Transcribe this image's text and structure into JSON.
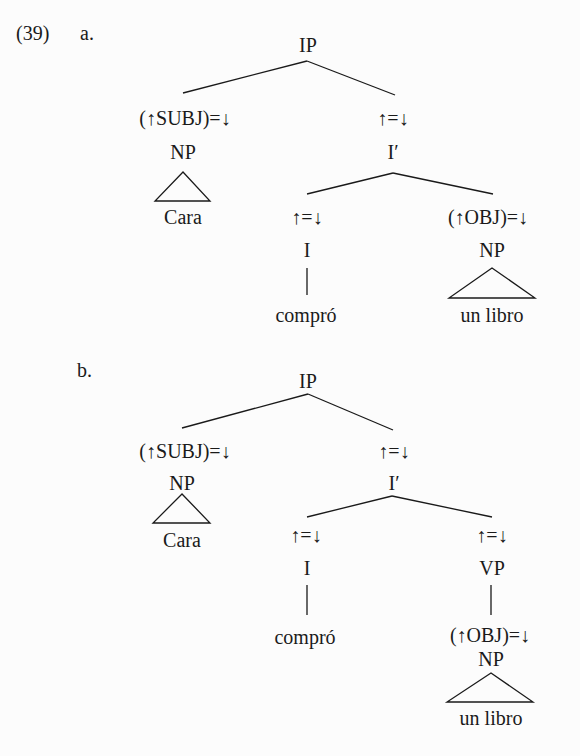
{
  "example_number": "(39)",
  "trees": [
    {
      "label": "a.",
      "root": "IP",
      "subj_annotation": "(↑SUBJ)=↓",
      "subj_category": "NP",
      "subj_word": "Cara",
      "ibar_annotation": "↑=↓",
      "ibar_category": "I′",
      "i_annotation": "↑=↓",
      "i_category": "I",
      "i_word": "compró",
      "obj_annotation": "(↑OBJ)=↓",
      "obj_category": "NP",
      "obj_words": "un libro"
    },
    {
      "label": "b.",
      "root": "IP",
      "subj_annotation": "(↑SUBJ)=↓",
      "subj_category": "NP",
      "subj_word": "Cara",
      "ibar_annotation": "↑=↓",
      "ibar_category": "I′",
      "i_annotation": "↑=↓",
      "i_category": "I",
      "i_word": "compró",
      "vp_annotation": "↑=↓",
      "vp_category": "VP",
      "obj_annotation": "(↑OBJ)=↓",
      "obj_category": "NP",
      "obj_words": "un libro"
    }
  ]
}
